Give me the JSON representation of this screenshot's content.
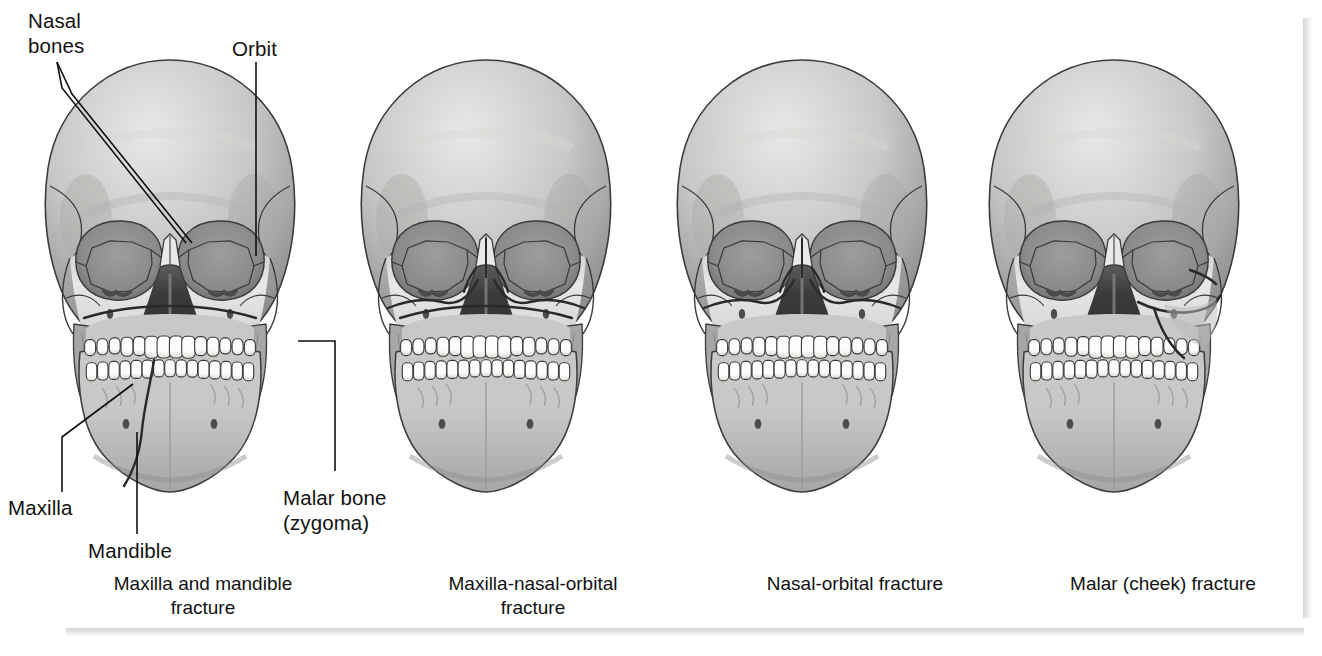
{
  "figure": {
    "kind": "medical-illustration",
    "background_color": "#ffffff",
    "ink_color": "#111111"
  },
  "callouts": [
    {
      "id": "nasal-bones",
      "label": "Nasal\nbones",
      "x": 28,
      "y": 8
    },
    {
      "id": "orbit",
      "label": "Orbit",
      "x": 232,
      "y": 36
    },
    {
      "id": "maxilla",
      "label": "Maxilla",
      "x": 8,
      "y": 495
    },
    {
      "id": "mandible",
      "label": "Mandible",
      "x": 88,
      "y": 538
    },
    {
      "id": "malar-bone",
      "label": "Malar bone\n(zygoma)",
      "x": 283,
      "y": 485
    }
  ],
  "panels": [
    {
      "index": 1,
      "caption": "Maxilla and mandible\nfracture",
      "caption_x": 48,
      "caption_y": 572,
      "caption_width": 310,
      "skull_x": 14,
      "skull_y": 52,
      "fractures": [
        "maxilla",
        "mandible"
      ],
      "has_callouts": true
    },
    {
      "index": 2,
      "caption": "Maxilla-nasal-orbital\nfracture",
      "caption_x": 378,
      "caption_y": 572,
      "caption_width": 310,
      "skull_x": 330,
      "skull_y": 52,
      "fractures": [
        "maxilla",
        "nasal",
        "orbital"
      ],
      "has_callouts": false
    },
    {
      "index": 3,
      "caption": "Nasal-orbital fracture",
      "caption_x": 700,
      "caption_y": 572,
      "caption_width": 310,
      "skull_x": 646,
      "skull_y": 52,
      "fractures": [
        "nasal",
        "orbital"
      ],
      "has_callouts": false
    },
    {
      "index": 4,
      "caption": "Malar (cheek) fracture",
      "caption_x": 1008,
      "caption_y": 572,
      "caption_width": 310,
      "skull_x": 958,
      "skull_y": 52,
      "fractures": [
        "malar"
      ],
      "has_callouts": false
    }
  ],
  "colors": {
    "bone_light": "#e9e8e6",
    "bone_mid": "#c9c8c6",
    "bone_shadow": "#a7a6a4",
    "bone_dark": "#8d8c8a",
    "cavity_dark": "#3a3a3a",
    "cavity_mid": "#5c5c5c",
    "orbit_fill": "#9e9d9b",
    "tooth": "#fbfbf9",
    "outline": "#3b3b3b",
    "fracture": "#2a2a2a"
  }
}
